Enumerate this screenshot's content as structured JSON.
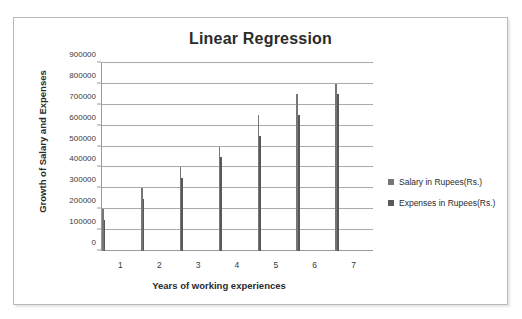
{
  "chart_data": {
    "type": "bar",
    "title": "Linear Regression",
    "xlabel": "Years of working experiences",
    "ylabel": "Growth of Salary and Expenses",
    "categories": [
      "1",
      "2",
      "3",
      "4",
      "5",
      "6",
      "7"
    ],
    "series": [
      {
        "name": "Salary in Rupees(Rs.)",
        "color": "#767676",
        "values": [
          200000,
          300000,
          400000,
          500000,
          650000,
          750000,
          800000
        ]
      },
      {
        "name": "Expenses in Rupees(Rs.)",
        "color": "#595959",
        "values": [
          150000,
          250000,
          350000,
          450000,
          550000,
          650000,
          750000
        ]
      }
    ],
    "ylim": [
      0,
      900000
    ],
    "ytick_step": 100000,
    "yticks": [
      "0",
      "100000",
      "200000",
      "300000",
      "400000",
      "500000",
      "600000",
      "700000",
      "800000",
      "900000"
    ],
    "grid": true,
    "legend_position": "right"
  }
}
